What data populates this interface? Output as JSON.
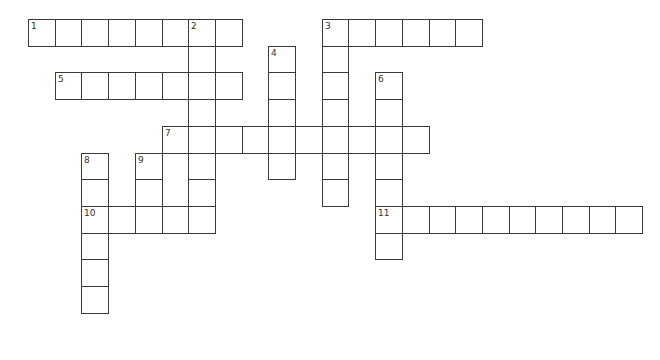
{
  "puzzle": {
    "cell_size": 26.7,
    "origin_x": 28,
    "origin_y": 19,
    "words": [
      {
        "number": "1",
        "direction": "across",
        "row": 0,
        "col": 0,
        "length": 8
      },
      {
        "number": "2",
        "direction": "down",
        "row": 0,
        "col": 6,
        "length": 8
      },
      {
        "number": "3",
        "direction": "across",
        "row": 0,
        "col": 11,
        "length": 6
      },
      {
        "number": "3",
        "direction": "down",
        "row": 0,
        "col": 11,
        "length": 7
      },
      {
        "number": "4",
        "direction": "down",
        "row": 1,
        "col": 9,
        "length": 5
      },
      {
        "number": "5",
        "direction": "across",
        "row": 2,
        "col": 1,
        "length": 7
      },
      {
        "number": "6",
        "direction": "down",
        "row": 2,
        "col": 13,
        "length": 7
      },
      {
        "number": "7",
        "direction": "across",
        "row": 4,
        "col": 5,
        "length": 10
      },
      {
        "number": "8",
        "direction": "down",
        "row": 5,
        "col": 2,
        "length": 6
      },
      {
        "number": "9",
        "direction": "down",
        "row": 5,
        "col": 4,
        "length": 3
      },
      {
        "number": "10",
        "direction": "across",
        "row": 7,
        "col": 2,
        "length": 5
      },
      {
        "number": "11",
        "direction": "across",
        "row": 7,
        "col": 13,
        "length": 10
      }
    ]
  },
  "colors": {
    "border": "#3a3a3a",
    "cell_bg": "#ffffff",
    "number": "#333333"
  }
}
